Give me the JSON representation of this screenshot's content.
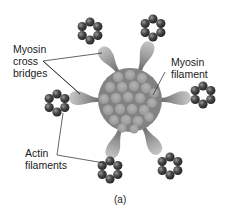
{
  "labels": {
    "cross_bridges_line1": "Myosin",
    "cross_bridges_line2": "cross",
    "cross_bridges_line3": "bridges",
    "myosin_filament_line1": "Myosin",
    "myosin_filament_line2": "filament",
    "actin_line1": "Actin",
    "actin_line2": "filaments",
    "caption": "(a)"
  },
  "colors": {
    "myosin_core": "#8a8a8a",
    "myosin_subunit": "#a8a8a8",
    "cross_bridge": "#a0a0a0",
    "actin_bead": "#4a4a4a",
    "leader_line": "#222222"
  },
  "structure": {
    "myosin_filament": {
      "cx": 130,
      "cy": 100,
      "r": 32
    },
    "actin_rings": [
      {
        "name": "top-left",
        "cx": 90,
        "cy": 31
      },
      {
        "name": "top-right",
        "cx": 153,
        "cy": 28
      },
      {
        "name": "right",
        "cx": 203,
        "cy": 95
      },
      {
        "name": "left",
        "cx": 57,
        "cy": 103
      },
      {
        "name": "bottom-left",
        "cx": 110,
        "cy": 170
      },
      {
        "name": "bottom-right",
        "cx": 170,
        "cy": 166
      }
    ]
  }
}
